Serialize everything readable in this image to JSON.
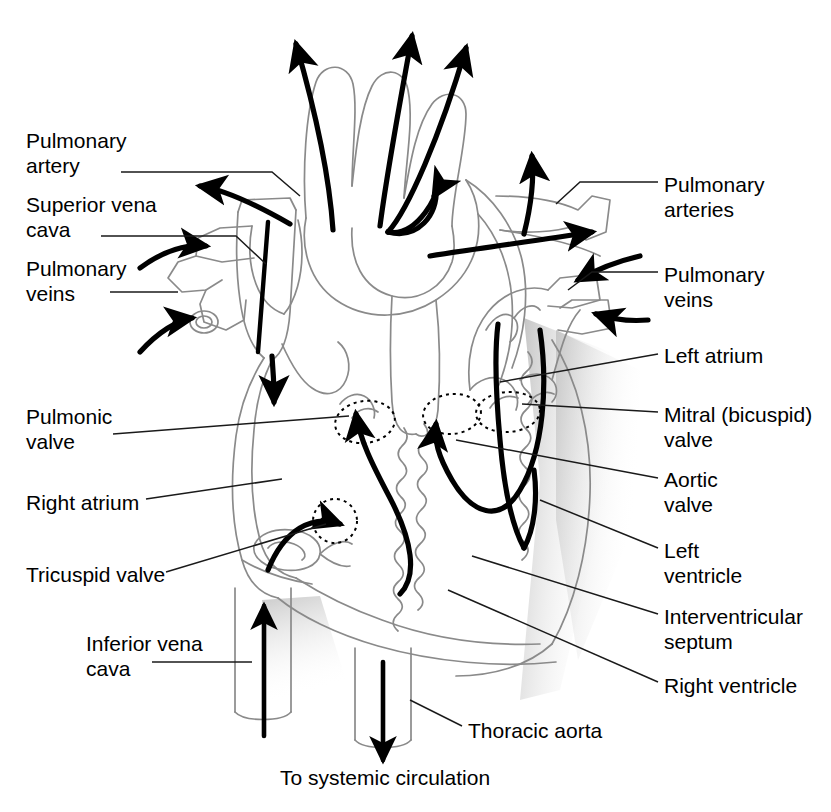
{
  "figure": {
    "type": "labeled anatomical diagram",
    "background_color": "#ffffff",
    "outline_color": "#7a7a7a",
    "flow_arrow_color": "#000000",
    "label_color": "#000000",
    "leader_line_color": "#1a1a1a",
    "shading_color": "#d9d9d9"
  },
  "labels": {
    "left": [
      {
        "id": "pulmonary-artery",
        "lines": [
          "Pulmonary",
          "artery"
        ],
        "x": 26,
        "y": 128
      },
      {
        "id": "superior-vena-cava",
        "lines": [
          "Superior vena",
          "cava"
        ],
        "x": 26,
        "y": 192
      },
      {
        "id": "pulmonary-veins",
        "lines": [
          "Pulmonary",
          "veins"
        ],
        "x": 26,
        "y": 256
      },
      {
        "id": "pulmonic-valve",
        "lines": [
          "Pulmonic",
          "valve"
        ],
        "x": 26,
        "y": 404
      },
      {
        "id": "right-atrium",
        "lines": [
          "Right atrium"
        ],
        "x": 26,
        "y": 490
      },
      {
        "id": "tricuspid-valve",
        "lines": [
          "Tricuspid valve"
        ],
        "x": 26,
        "y": 562
      },
      {
        "id": "inferior-vena-cava",
        "lines": [
          "Inferior vena",
          "cava"
        ],
        "x": 86,
        "y": 631
      }
    ],
    "right": [
      {
        "id": "pulmonary-arteries",
        "lines": [
          "Pulmonary",
          "arteries"
        ],
        "x": 664,
        "y": 172
      },
      {
        "id": "pulmonary-veins-right",
        "lines": [
          "Pulmonary",
          "veins"
        ],
        "x": 664,
        "y": 262
      },
      {
        "id": "left-atrium",
        "lines": [
          "Left atrium"
        ],
        "x": 664,
        "y": 343
      },
      {
        "id": "mitral-bicuspid-valve",
        "lines": [
          "Mitral (bicuspid)",
          "valve"
        ],
        "x": 664,
        "y": 402
      },
      {
        "id": "aortic-valve",
        "lines": [
          "Aortic",
          "valve"
        ],
        "x": 664,
        "y": 467
      },
      {
        "id": "left-ventricle",
        "lines": [
          "Left",
          "ventricle"
        ],
        "x": 664,
        "y": 538
      },
      {
        "id": "interventricular-septum",
        "lines": [
          "Interventricular",
          "septum"
        ],
        "x": 664,
        "y": 604
      },
      {
        "id": "right-ventricle",
        "lines": [
          "Right ventricle"
        ],
        "x": 664,
        "y": 673
      }
    ],
    "bottom": [
      {
        "id": "thoracic-aorta",
        "lines": [
          "Thoracic aorta"
        ],
        "x": 468,
        "y": 718
      },
      {
        "id": "to-systemic-circulation",
        "lines": [
          "To systemic circulation"
        ],
        "x": 280,
        "y": 765
      }
    ]
  },
  "valve_markers": [
    {
      "id": "pulmonic-valve-marker",
      "cx": 365,
      "cy": 422,
      "rx": 30,
      "ry": 21,
      "rot": -8
    },
    {
      "id": "aortic-valve-marker",
      "cx": 452,
      "cy": 414,
      "rx": 29,
      "ry": 20,
      "rot": -6
    },
    {
      "id": "mitral-valve-marker",
      "cx": 508,
      "cy": 412,
      "rx": 32,
      "ry": 20,
      "rot": -4
    },
    {
      "id": "tricuspid-valve-marker",
      "cx": 335,
      "cy": 521,
      "rx": 22,
      "ry": 22,
      "rot": 0
    }
  ],
  "flow_arrows": [
    {
      "id": "arrow-brachiocephalic-up",
      "direction": "up-left",
      "meaning": "out to head and arms"
    },
    {
      "id": "arrow-left-carotid-up",
      "direction": "up",
      "meaning": "out to head"
    },
    {
      "id": "arrow-left-subclavian-up",
      "direction": "up-right",
      "meaning": "out to arm"
    },
    {
      "id": "arrow-aortic-arch-descend",
      "direction": "down-right",
      "meaning": "down descending aorta"
    },
    {
      "id": "arrow-pulmonary-trunk-left",
      "direction": "left",
      "meaning": "to left lung"
    },
    {
      "id": "arrow-pulmonary-right",
      "direction": "right",
      "meaning": "to right lung"
    },
    {
      "id": "arrow-pulmonary-artery-up",
      "direction": "up",
      "meaning": "to right lung upper"
    },
    {
      "id": "arrow-svc-in",
      "direction": "right",
      "meaning": "blood entering superior vena cava"
    },
    {
      "id": "arrow-pulmonary-vein-left-in",
      "direction": "up-right",
      "meaning": "oxygenated blood returning"
    },
    {
      "id": "arrow-pulmonary-vein-right-in1",
      "direction": "left",
      "meaning": "oxygenated blood returning"
    },
    {
      "id": "arrow-pulmonary-vein-right-in2",
      "direction": "left",
      "meaning": "oxygenated blood returning"
    },
    {
      "id": "arrow-right-atrium-down",
      "direction": "down",
      "meaning": "into right ventricle"
    },
    {
      "id": "arrow-tricuspid-flow",
      "direction": "down-right",
      "meaning": "through tricuspid valve"
    },
    {
      "id": "arrow-right-ventricle-out",
      "direction": "up",
      "meaning": "out through pulmonic valve"
    },
    {
      "id": "arrow-left-ventricle-out",
      "direction": "up-left",
      "meaning": "out through aortic valve"
    },
    {
      "id": "arrow-left-atrium-down",
      "direction": "down",
      "meaning": "through mitral valve"
    },
    {
      "id": "arrow-ivc-up",
      "direction": "up",
      "meaning": "blood entering from inferior vena cava"
    },
    {
      "id": "arrow-aorta-down",
      "direction": "down",
      "meaning": "to systemic circulation"
    }
  ]
}
